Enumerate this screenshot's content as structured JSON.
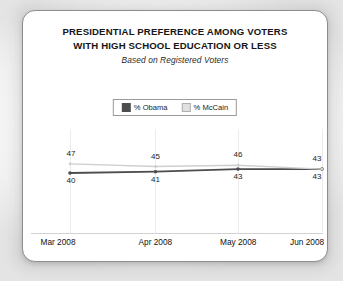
{
  "card": {
    "title_line1": "PRESIDENTIAL PREFERENCE AMONG VOTERS",
    "title_line2": "WITH HIGH SCHOOL EDUCATION OR LESS",
    "subtitle": "Based on Registered Voters"
  },
  "legend": {
    "position": "top-center",
    "entries": [
      {
        "label": "% Obama",
        "color": "#4d4d4d",
        "swatch": "obama"
      },
      {
        "label": "% McCain",
        "color": "#e0e0e0",
        "swatch": "mccain"
      }
    ]
  },
  "chart_data": {
    "type": "line",
    "title": "PRESIDENTIAL PREFERENCE AMONG VOTERS WITH HIGH SCHOOL EDUCATION OR LESS",
    "subtitle": "Based on Registered Voters",
    "categories": [
      "Mar 2008",
      "Apr 2008",
      "May 2008",
      "Jun 2008"
    ],
    "series": [
      {
        "name": "% Obama",
        "color": "#4d4d4d",
        "values": [
          40,
          41,
          43,
          43
        ],
        "label_position": "below"
      },
      {
        "name": "% McCain",
        "color": "#cfcfcf",
        "values": [
          47,
          45,
          46,
          43
        ],
        "label_position": "above"
      }
    ],
    "xlabel": "",
    "ylabel": "",
    "ylim": [
      0,
      60
    ],
    "grid": "vertical-only",
    "legend_position": "top-center",
    "data_labels": true
  }
}
